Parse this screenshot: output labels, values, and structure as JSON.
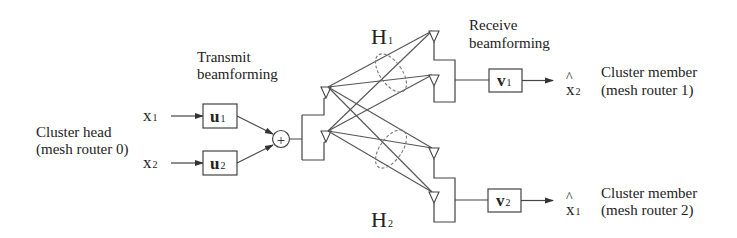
{
  "diagram": {
    "type": "mimo-beamforming-block-diagram",
    "source_node": {
      "label_line1": "Cluster head",
      "label_line2": "(mesh router 0)"
    },
    "inputs": [
      {
        "symbol": "x",
        "sub": "1"
      },
      {
        "symbol": "x",
        "sub": "2"
      }
    ],
    "transmit": {
      "label_line1": "Transmit",
      "label_line2": "beamforming",
      "weights": [
        {
          "symbol": "u",
          "sub": "1"
        },
        {
          "symbol": "u",
          "sub": "2"
        }
      ],
      "combiner": "+"
    },
    "channels": [
      {
        "symbol": "H",
        "sub": "1"
      },
      {
        "symbol": "H",
        "sub": "2"
      }
    ],
    "receive": {
      "label_line1": "Receive",
      "label_line2": "beamforming",
      "weights": [
        {
          "symbol": "v",
          "sub": "1"
        },
        {
          "symbol": "v",
          "sub": "2"
        }
      ]
    },
    "outputs": [
      {
        "hat": "^",
        "symbol": "x",
        "sub": "2",
        "label_line1": "Cluster member",
        "label_line2": "(mesh router 1)"
      },
      {
        "hat": "^",
        "symbol": "x",
        "sub": "1",
        "label_line1": "Cluster member",
        "label_line2": "(mesh router 2)"
      }
    ],
    "colors": {
      "line": "#444444",
      "background": "#ffffff",
      "text": "#222222"
    }
  }
}
